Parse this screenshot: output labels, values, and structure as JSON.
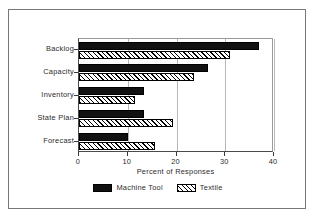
{
  "chart_data": {
    "type": "bar",
    "orientation": "horizontal",
    "title": "",
    "xlabel": "Percent of Responses",
    "ylabel": "",
    "categories": [
      "Backlog",
      "Capacity",
      "Inventory",
      "State Plan",
      "Forecast"
    ],
    "series": [
      {
        "name": "Machine Tool",
        "values": [
          37.0,
          26.5,
          13.3,
          13.3,
          10.0
        ],
        "fill": "solid-black",
        "color": "#111111"
      },
      {
        "name": "Textile",
        "values": [
          31.0,
          23.5,
          11.5,
          19.3,
          15.5
        ],
        "fill": "diagonal-hatch",
        "color": "#ffffff"
      }
    ],
    "xlim": [
      0,
      40
    ],
    "xticks": [
      "0",
      "10",
      "20",
      "30",
      "40"
    ],
    "xtick_values": [
      0,
      10,
      20,
      30,
      40
    ],
    "grid": "vertical",
    "legend_position": "bottom-center",
    "frame": true
  }
}
